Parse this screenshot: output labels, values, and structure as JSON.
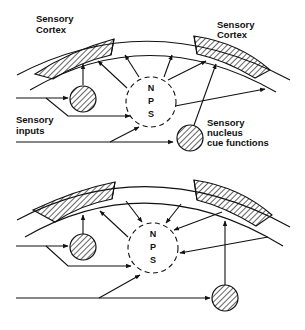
{
  "figure": {
    "top_panel": {
      "labels": {
        "cortex_left_line1": "Sensory",
        "cortex_left_line2": "Cortex",
        "cortex_right_line1": "Sensory",
        "cortex_right_line2": "Cortex",
        "inputs_line1": "Sensory",
        "inputs_line2": "inputs",
        "nucleus_line1": "Sensory",
        "nucleus_line2": "nucleus",
        "nucleus_line3": "cue functions"
      },
      "nps": {
        "n": "N",
        "p": "P",
        "s": "S"
      }
    },
    "bottom_panel": {
      "nps": {
        "n": "N",
        "p": "P",
        "s": "S"
      }
    }
  }
}
